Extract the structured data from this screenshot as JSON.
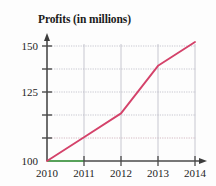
{
  "chart_data": {
    "type": "line",
    "title": "Profits (in millions)",
    "xlabel": "",
    "ylabel": "",
    "x": [
      "2010",
      "2011",
      "2012",
      "2013",
      "2014"
    ],
    "categories": [
      "2010",
      "2011",
      "2012",
      "2013",
      "2014"
    ],
    "values": [
      100,
      112.5,
      125,
      150,
      162.5
    ],
    "series": [
      {
        "name": "Profits",
        "values": [
          100,
          112.5,
          125,
          150,
          162.5
        ],
        "color": "#d4426a"
      }
    ],
    "xlim": [
      2010,
      2014
    ],
    "ylim": [
      100,
      162.5
    ],
    "ytick_labels": [
      "100",
      "125",
      "150"
    ],
    "ytick_values": [
      100,
      125,
      150
    ],
    "yticks_all": [
      100,
      112.5,
      125,
      137.5,
      150,
      162.5
    ],
    "xtick_labels": [
      "2010",
      "2011",
      "2012",
      "2013",
      "2014"
    ],
    "grid": true,
    "grid_color": "#b9b9c4",
    "legend": false,
    "legend_position": "none",
    "axis_color": "#4a4a4a",
    "axis_arrows": [
      "up",
      "right"
    ],
    "baseline_highlight_color": "#4caf50",
    "baseline_highlight_span": [
      "2010",
      "2011"
    ]
  },
  "axis": {
    "y_labels": [
      {
        "text": "150",
        "value": 150
      },
      {
        "text": "125",
        "value": 125
      },
      {
        "text": "100",
        "value": 100
      }
    ],
    "x_labels": [
      {
        "text": "2010"
      },
      {
        "text": "2011"
      },
      {
        "text": "2012"
      },
      {
        "text": "2013"
      },
      {
        "text": "2014"
      }
    ]
  }
}
